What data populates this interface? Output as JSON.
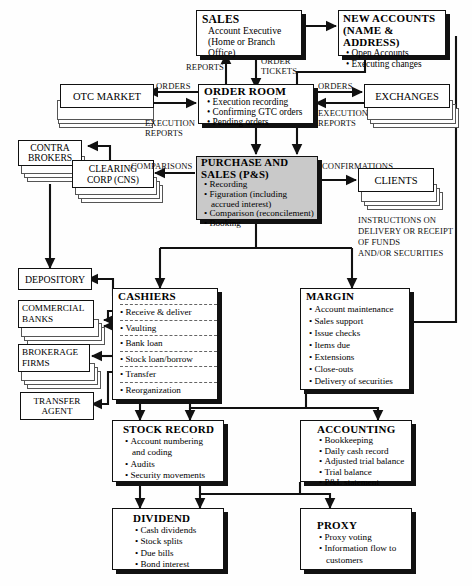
{
  "diagram": {
    "background": "#fefefe",
    "line_color": "#111111",
    "highlight_fill": "#c9c9c9",
    "box_fill": "#ffffff"
  },
  "nodes": {
    "sales": {
      "title": "SALES",
      "lines": [
        "Account Executive",
        "(Home or Branch Office)"
      ],
      "bullets": [],
      "style": "plain"
    },
    "new_accounts": {
      "title": "NEW ACCOUNTS",
      "title2": "(NAME & ADDRESS)",
      "bullets": [
        "Open Accounts",
        "Executing changes"
      ],
      "style": "plain"
    },
    "order_room": {
      "title": "ORDER ROOM",
      "bullets": [
        "Execution recording",
        "Confirming GTC orders",
        "Pending orders"
      ],
      "style": "plain"
    },
    "otc_market": {
      "title": "OTC MARKET",
      "bullets": [],
      "style": "stack-left"
    },
    "exchanges": {
      "title": "EXCHANGES",
      "bullets": [],
      "style": "stack-right"
    },
    "contra_brokers": {
      "title": "CONTRA",
      "title2": "BROKERS",
      "bullets": [],
      "style": "stack-right"
    },
    "clearing_corp": {
      "title": "CLEARING",
      "title2": "CORP (CNS)",
      "bullets": [],
      "style": "stack-right"
    },
    "purchase_sales": {
      "title": "PURCHASE AND",
      "title2": "SALES (P&S)",
      "bullets": [
        "Recording",
        "Figuration (including",
        "accrued interest)",
        "Comparison (reconcilement)",
        "Booking"
      ],
      "style": "shaded"
    },
    "clients": {
      "title": "CLIENTS",
      "bullets": [],
      "style": "stack-right"
    },
    "depository": {
      "title": "DEPOSITORY",
      "bullets": [],
      "style": "plain-thin"
    },
    "commercial_banks": {
      "title": "COMMERCIAL",
      "title2": "BANKS",
      "bullets": [],
      "style": "stack-right"
    },
    "brokerage_firms": {
      "title": "BROKERAGE",
      "title2": "FIRMS",
      "bullets": [],
      "style": "stack-right"
    },
    "transfer_agent": {
      "title": "TRANSFER",
      "title2": "AGENT",
      "bullets": [],
      "style": "plain-thin"
    },
    "cashiers": {
      "title": "CASHIERS",
      "bullets": [
        "Receive & deliver",
        "Vaulting",
        "Bank loan",
        "Stock loan/borrow",
        "Transfer",
        "Reorganization"
      ],
      "style": "dashed-rows"
    },
    "margin": {
      "title": "MARGIN",
      "bullets": [
        "Account maintenance",
        "Sales support",
        "Issue checks",
        "Items due",
        "Extensions",
        "Close-outs",
        "Delivery of securities"
      ],
      "style": "plain"
    },
    "stock_record": {
      "title": "STOCK RECORD",
      "bullets": [
        "Account numbering",
        "and coding",
        "Audits",
        "Security movements"
      ],
      "style": "plain"
    },
    "accounting": {
      "title": "ACCOUNTING",
      "bullets": [
        "Bookkeeping",
        "Daily cash record",
        "Adjusted trial balance",
        "Trial balance",
        "P&L statement"
      ],
      "style": "plain"
    },
    "dividend": {
      "title": "DIVIDEND",
      "bullets": [
        "Cash dividends",
        "Stock splits",
        "Due bills",
        "Bond interest"
      ],
      "style": "plain"
    },
    "proxy": {
      "title": "PROXY",
      "bullets": [
        "Proxy voting",
        "Information flow to",
        "customers"
      ],
      "style": "plain"
    }
  },
  "edge_labels": {
    "reports": "REPORTS",
    "order_tickets_1": "ORDER",
    "order_tickets_2": "TICKETS",
    "orders_left": "ORDERS",
    "orders_right": "ORDERS",
    "exec_reports_left_1": "EXECUTION",
    "exec_reports_left_2": "REPORTS",
    "exec_reports_right_1": "EXECUTION",
    "exec_reports_right_2": "REPORTS",
    "comparisons": "COMPARISONS",
    "confirmations": "CONFIRMATIONS",
    "instructions_1": "INSTRUCTIONS ON",
    "instructions_2": "DELIVERY OR RECEIPT",
    "instructions_3": "OF FUNDS",
    "instructions_4": "AND/OR SECURITIES"
  }
}
